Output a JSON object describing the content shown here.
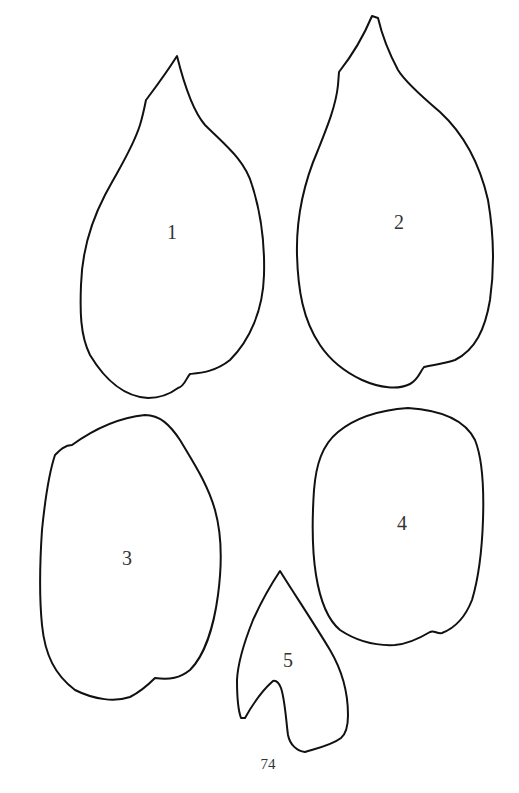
{
  "shapes": [
    {
      "id": "1",
      "label": "1"
    },
    {
      "id": "2",
      "label": "2"
    },
    {
      "id": "3",
      "label": "3"
    },
    {
      "id": "4",
      "label": "4"
    },
    {
      "id": "5",
      "label": "5"
    }
  ],
  "page_number": "74",
  "colors": {
    "outline": "#111111",
    "background": "#ffffff",
    "text": "#333333"
  }
}
